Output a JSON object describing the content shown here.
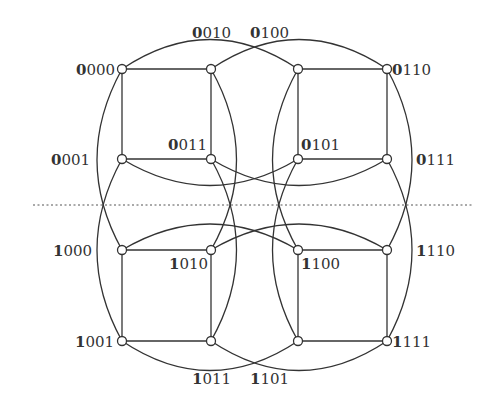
{
  "diagram": {
    "divider": {
      "style": "dotted",
      "x1": 33,
      "x2": 474,
      "y": 205
    },
    "nodes": [
      {
        "id": "0000",
        "x": 122,
        "y": 69,
        "msb": "0",
        "rest": "000",
        "lx": 76,
        "ly": 75,
        "anchor": "start"
      },
      {
        "id": "0100",
        "x": 211,
        "y": 69,
        "msb": "0",
        "rest": "100",
        "lx": 250,
        "ly": 38,
        "anchor": "start"
      },
      {
        "id": "0010",
        "x": 298,
        "y": 69,
        "msb": "0",
        "rest": "010",
        "lx": 192,
        "ly": 38,
        "anchor": "start"
      },
      {
        "id": "0110",
        "x": 387,
        "y": 69,
        "msb": "0",
        "rest": "110",
        "lx": 392,
        "ly": 75,
        "anchor": "start"
      },
      {
        "id": "0001",
        "x": 122,
        "y": 159,
        "msb": "0",
        "rest": "001",
        "lx": 51,
        "ly": 165,
        "anchor": "start"
      },
      {
        "id": "0011",
        "x": 211,
        "y": 159,
        "msb": "0",
        "rest": "011",
        "lx": 168,
        "ly": 150,
        "anchor": "start"
      },
      {
        "id": "0101",
        "x": 298,
        "y": 159,
        "msb": "0",
        "rest": "101",
        "lx": 301,
        "ly": 150,
        "anchor": "start"
      },
      {
        "id": "0111",
        "x": 387,
        "y": 159,
        "msb": "0",
        "rest": "111",
        "lx": 416,
        "ly": 165,
        "anchor": "start"
      },
      {
        "id": "1000",
        "x": 122,
        "y": 250,
        "msb": "1",
        "rest": "000",
        "lx": 53,
        "ly": 256,
        "anchor": "start"
      },
      {
        "id": "1010",
        "x": 211,
        "y": 250,
        "msb": "1",
        "rest": "010",
        "lx": 169,
        "ly": 269,
        "anchor": "start"
      },
      {
        "id": "1100",
        "x": 298,
        "y": 250,
        "msb": "1",
        "rest": "100",
        "lx": 301,
        "ly": 269,
        "anchor": "start"
      },
      {
        "id": "1110",
        "x": 387,
        "y": 250,
        "msb": "1",
        "rest": "110",
        "lx": 416,
        "ly": 256,
        "anchor": "start"
      },
      {
        "id": "1001",
        "x": 122,
        "y": 341,
        "msb": "1",
        "rest": "001",
        "lx": 75,
        "ly": 347,
        "anchor": "start"
      },
      {
        "id": "1011",
        "x": 211,
        "y": 341,
        "msb": "1",
        "rest": "011",
        "lx": 192,
        "ly": 384,
        "anchor": "start"
      },
      {
        "id": "1101",
        "x": 298,
        "y": 341,
        "msb": "1",
        "rest": "101",
        "lx": 250,
        "ly": 384,
        "anchor": "start"
      },
      {
        "id": "1111",
        "x": 387,
        "y": 341,
        "msb": "1",
        "rest": "111",
        "lx": 392,
        "ly": 347,
        "anchor": "start"
      }
    ],
    "edges": [
      {
        "from": "0000",
        "to": "0100",
        "d": "M122,69 L211,69"
      },
      {
        "from": "0010",
        "to": "0110",
        "d": "M298,69 L387,69"
      },
      {
        "from": "0001",
        "to": "0011",
        "d": "M122,159 L211,159"
      },
      {
        "from": "0101",
        "to": "0111",
        "d": "M298,159 L387,159"
      },
      {
        "from": "0000",
        "to": "0001",
        "d": "M122,69 L122,159"
      },
      {
        "from": "0100",
        "to": "0011",
        "d": "M211,69 L211,159"
      },
      {
        "from": "0010",
        "to": "0101",
        "d": "M298,69 L298,159"
      },
      {
        "from": "0110",
        "to": "0111",
        "d": "M387,69 L387,159"
      },
      {
        "from": "1000",
        "to": "1010",
        "d": "M122,250 L211,250"
      },
      {
        "from": "1100",
        "to": "1110",
        "d": "M298,250 L387,250"
      },
      {
        "from": "1001",
        "to": "1011",
        "d": "M122,341 L211,341"
      },
      {
        "from": "1101",
        "to": "1111",
        "d": "M298,341 L387,341"
      },
      {
        "from": "1000",
        "to": "1001",
        "d": "M122,250 L122,341"
      },
      {
        "from": "1010",
        "to": "1011",
        "d": "M211,250 L211,341"
      },
      {
        "from": "1100",
        "to": "1101",
        "d": "M298,250 L298,341"
      },
      {
        "from": "1110",
        "to": "1111",
        "d": "M387,250 L387,341"
      },
      {
        "from": "0000",
        "to": "0010",
        "d": "M122,69 Q210,10 298,69"
      },
      {
        "from": "0100",
        "to": "0110",
        "d": "M211,69 Q299,10 387,69"
      },
      {
        "from": "0001",
        "to": "0101",
        "d": "M122,159 Q210,212 298,159"
      },
      {
        "from": "0011",
        "to": "0111",
        "d": "M211,159 Q299,212 387,159"
      },
      {
        "from": "1000",
        "to": "1100",
        "d": "M122,250 Q210,198 298,250"
      },
      {
        "from": "1010",
        "to": "1110",
        "d": "M211,250 Q299,198 387,250"
      },
      {
        "from": "1001",
        "to": "1101",
        "d": "M122,341 Q210,400 298,341"
      },
      {
        "from": "1011",
        "to": "1111",
        "d": "M211,341 Q299,400 387,341"
      },
      {
        "from": "0000",
        "to": "1000",
        "d": "M122,69 Q72,160 122,250"
      },
      {
        "from": "0001",
        "to": "1001",
        "d": "M122,159 Q72,250 122,341"
      },
      {
        "from": "0100",
        "to": "1100",
        "d": "M211,69 Q262,160 211,250"
      },
      {
        "from": "0011",
        "to": "1011",
        "d": "M211,159 Q262,250 211,341"
      },
      {
        "from": "0010",
        "to": "1010",
        "d": "M298,69 Q247,160 298,250"
      },
      {
        "from": "0101",
        "to": "1101",
        "d": "M298,159 Q247,250 298,341"
      },
      {
        "from": "0110",
        "to": "1110",
        "d": "M387,69 Q437,160 387,250"
      },
      {
        "from": "0111",
        "to": "1111",
        "d": "M387,159 Q437,250 387,341"
      }
    ],
    "colors": {
      "line": "#333333",
      "node_fill": "#ffffff",
      "background": "#ffffff"
    }
  }
}
